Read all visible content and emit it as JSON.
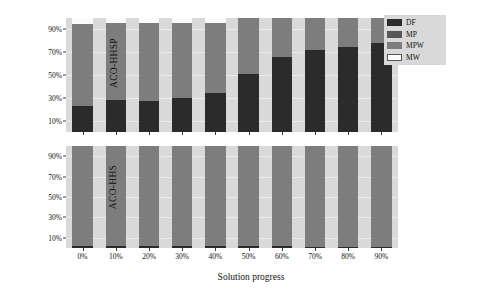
{
  "chart_data": {
    "type": "bar",
    "title": "",
    "subtitle": "",
    "xlabel": "Solution progress",
    "categories": [
      "0%",
      "10%",
      "20%",
      "30%",
      "40%",
      "50%",
      "60%",
      "70%",
      "80%",
      "90%"
    ],
    "legend": {
      "position": "top-right",
      "entries": [
        {
          "name": "DF",
          "color": "#2b2b2b"
        },
        {
          "name": "MP",
          "color": "#575757"
        },
        {
          "name": "MPW",
          "color": "#7d7d7d"
        },
        {
          "name": "MW",
          "color": "#fbfbfb"
        }
      ]
    },
    "grid": true,
    "stacked": true,
    "yticks": [
      "10%",
      "30%",
      "50%",
      "70%",
      "90%"
    ],
    "ytick_values": [
      10,
      30,
      50,
      70,
      90
    ],
    "ylim": [
      0,
      100
    ],
    "panels": [
      {
        "ylabel": "ACO-HHSP",
        "series": [
          {
            "name": "DF",
            "values": [
              23,
              28,
              27,
              30,
              34,
              51,
              66,
              72,
              75,
              78
            ]
          },
          {
            "name": "MP",
            "values": [
              0,
              0,
              0,
              0,
              0,
              0,
              0,
              0,
              0,
              0
            ]
          },
          {
            "name": "MPW",
            "values": [
              72,
              68,
              69,
              66,
              62,
              49,
              34,
              28,
              25,
              22
            ]
          },
          {
            "name": "MW",
            "values": [
              5,
              4,
              4,
              4,
              4,
              0,
              0,
              0,
              0,
              0
            ]
          }
        ]
      },
      {
        "ylabel": "ACO-HHS",
        "series": [
          {
            "name": "DF",
            "values": [
              2,
              2,
              2,
              2,
              2,
              2,
              2,
              1,
              1,
              1
            ]
          },
          {
            "name": "MP",
            "values": [
              0,
              0,
              0,
              0,
              0,
              0,
              0,
              0,
              0,
              0
            ]
          },
          {
            "name": "MPW",
            "values": [
              98,
              98,
              98,
              98,
              98,
              98,
              98,
              99,
              99,
              99
            ]
          },
          {
            "name": "MW",
            "values": [
              0,
              0,
              0,
              0,
              0,
              0,
              0,
              0,
              0,
              0
            ]
          }
        ]
      }
    ]
  }
}
